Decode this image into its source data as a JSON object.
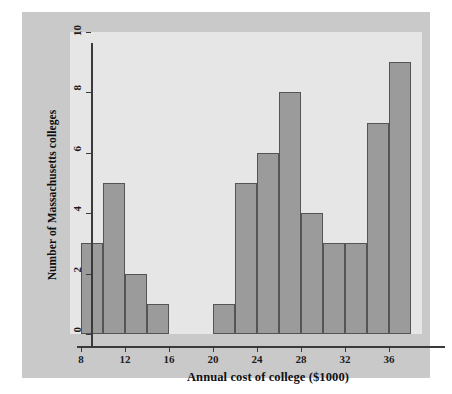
{
  "figure": {
    "background_color": "#c9c9c9",
    "plot_background_color": "#e6e6e6",
    "bar_fill_color": "#9b9b9b",
    "bar_edge_color": "#545454",
    "axis_color": "#3a3a3a"
  },
  "chart_data": {
    "type": "bar",
    "title": "",
    "subtitle": "",
    "xlabel": "Annual cost of college ($1000)",
    "ylabel": "Number of Massachusetts colleges",
    "grid": false,
    "legend": null,
    "legend_position": "none",
    "bin_width": 2,
    "xlim": [
      7,
      39
    ],
    "ylim": [
      0,
      10
    ],
    "xticks": [
      8,
      12,
      16,
      20,
      24,
      28,
      32,
      36
    ],
    "xtick_labels": [
      "8",
      "12",
      "16",
      "20",
      "24",
      "28",
      "32",
      "36"
    ],
    "yticks": [
      0,
      2,
      4,
      6,
      8,
      10
    ],
    "ytick_labels": [
      "0",
      "2",
      "4",
      "6",
      "8",
      "10"
    ],
    "bins": [
      {
        "start": 8,
        "end": 10,
        "count": 3
      },
      {
        "start": 10,
        "end": 12,
        "count": 5
      },
      {
        "start": 12,
        "end": 14,
        "count": 2
      },
      {
        "start": 14,
        "end": 16,
        "count": 1
      },
      {
        "start": 16,
        "end": 18,
        "count": 0
      },
      {
        "start": 18,
        "end": 20,
        "count": 0
      },
      {
        "start": 20,
        "end": 22,
        "count": 1
      },
      {
        "start": 22,
        "end": 24,
        "count": 5
      },
      {
        "start": 24,
        "end": 26,
        "count": 6
      },
      {
        "start": 26,
        "end": 28,
        "count": 8
      },
      {
        "start": 28,
        "end": 30,
        "count": 4
      },
      {
        "start": 30,
        "end": 32,
        "count": 3
      },
      {
        "start": 32,
        "end": 34,
        "count": 3
      },
      {
        "start": 34,
        "end": 36,
        "count": 7
      },
      {
        "start": 36,
        "end": 38,
        "count": 9
      }
    ],
    "categories": [
      "8-10",
      "10-12",
      "12-14",
      "14-16",
      "16-18",
      "18-20",
      "20-22",
      "22-24",
      "24-26",
      "26-28",
      "28-30",
      "30-32",
      "32-34",
      "34-36",
      "36-38"
    ],
    "values": [
      3,
      5,
      2,
      1,
      0,
      0,
      1,
      5,
      6,
      8,
      4,
      3,
      3,
      7,
      9
    ]
  }
}
